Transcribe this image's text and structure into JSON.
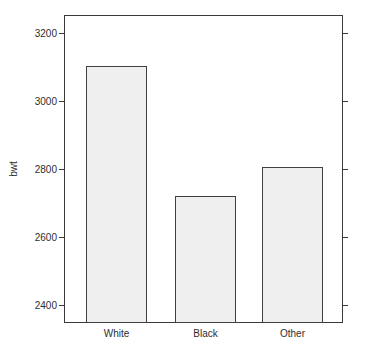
{
  "chart_data": {
    "type": "bar",
    "title": "",
    "xlabel": "",
    "ylabel": "bwt",
    "categories": [
      "White",
      "Black",
      "Other"
    ],
    "values": [
      3103,
      2720,
      2805
    ],
    "yticks": [
      2400,
      2600,
      2800,
      3000,
      3200
    ],
    "ylim": [
      2347,
      3253
    ],
    "grid": false,
    "legend_position": "none",
    "tick_sides": [
      "left",
      "right"
    ],
    "colors": {
      "background": "#ffffff",
      "bar_fill": "#efefef",
      "bar_border": "#404040",
      "axis": "#3a3a3a",
      "text": "#2e2e2e"
    }
  }
}
